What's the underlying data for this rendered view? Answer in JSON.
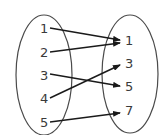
{
  "diagram": {
    "type": "mapping",
    "domain": {
      "items": [
        {
          "label": "1",
          "x": 44,
          "y": 33
        },
        {
          "label": "2",
          "x": 44,
          "y": 57
        },
        {
          "label": "3",
          "x": 44,
          "y": 80
        },
        {
          "label": "4",
          "x": 44,
          "y": 103
        },
        {
          "label": "5",
          "x": 44,
          "y": 127
        }
      ]
    },
    "range": {
      "items": [
        {
          "label": "1",
          "x": 129,
          "y": 45
        },
        {
          "label": "3",
          "x": 129,
          "y": 68
        },
        {
          "label": "5",
          "x": 129,
          "y": 91
        },
        {
          "label": "7",
          "x": 129,
          "y": 115
        }
      ]
    },
    "mappings": [
      {
        "from": "1",
        "to": "1"
      },
      {
        "from": "2",
        "to": "1"
      },
      {
        "from": "3",
        "to": "5"
      },
      {
        "from": "4",
        "to": "3"
      },
      {
        "from": "5",
        "to": "7"
      }
    ],
    "colors": {
      "stroke": "#1a1a1a",
      "ellipse": "#4a4a4a",
      "text": "#3a3a3a"
    }
  }
}
